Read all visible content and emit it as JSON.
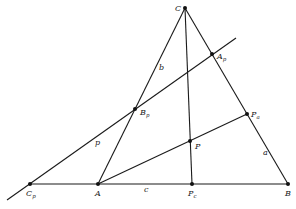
{
  "diagram": {
    "type": "geometry",
    "colors": {
      "line": "#1a1a1a",
      "point": "#111111",
      "background": "#ffffff"
    },
    "points": [
      {
        "id": "C",
        "main": "C",
        "sub": "",
        "x": 185,
        "y": 8,
        "lx": 175,
        "ly": 11
      },
      {
        "id": "Ap",
        "main": "A",
        "sub": "p",
        "x": 212,
        "y": 54,
        "lx": 217,
        "ly": 59
      },
      {
        "id": "Bp",
        "main": "B",
        "sub": "p",
        "x": 135,
        "y": 109,
        "lx": 140,
        "ly": 115
      },
      {
        "id": "Pa",
        "main": "P",
        "sub": "a",
        "x": 247,
        "y": 114,
        "lx": 251,
        "ly": 117
      },
      {
        "id": "P",
        "main": "P",
        "sub": "",
        "x": 190,
        "y": 141,
        "lx": 195,
        "ly": 149
      },
      {
        "id": "Cp",
        "main": "C",
        "sub": "p",
        "x": 30,
        "y": 184,
        "lx": 26,
        "ly": 196
      },
      {
        "id": "A",
        "main": "A",
        "sub": "",
        "x": 98,
        "y": 184,
        "lx": 95,
        "ly": 196
      },
      {
        "id": "Pc",
        "main": "P",
        "sub": "c",
        "x": 192,
        "y": 184,
        "lx": 188,
        "ly": 196
      },
      {
        "id": "B",
        "main": "B",
        "sub": "",
        "x": 288,
        "y": 184,
        "lx": 285,
        "ly": 196
      }
    ],
    "segments": [
      {
        "name": "side-b",
        "from": "A",
        "to": "C"
      },
      {
        "name": "side-a",
        "from": "C",
        "to": "B"
      },
      {
        "name": "side-c-extended",
        "from": "Cp",
        "to": "B"
      },
      {
        "name": "cevian-c",
        "from": "C",
        "to": "Pc"
      },
      {
        "name": "cevian-a",
        "from": "A",
        "to": "Pa"
      },
      {
        "name": "line-p",
        "x1": 7,
        "y1": 200,
        "x2": 236,
        "y2": 38
      }
    ],
    "side_labels": [
      {
        "name": "label-b",
        "text": "b",
        "x": 159,
        "y": 70
      },
      {
        "name": "label-p",
        "text": "p",
        "x": 95,
        "y": 145
      },
      {
        "name": "label-c",
        "text": "c",
        "x": 144,
        "y": 192
      },
      {
        "name": "label-a",
        "text": "a",
        "x": 263,
        "y": 155
      }
    ]
  }
}
